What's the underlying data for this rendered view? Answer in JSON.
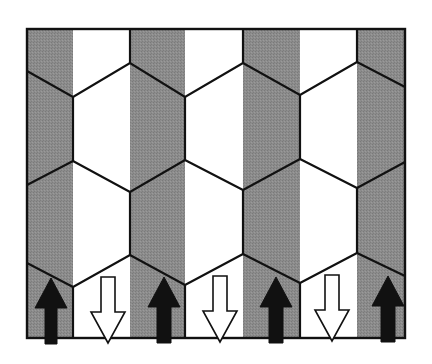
{
  "diagram": {
    "title": "",
    "colors": {
      "background": "#ffffff",
      "gray_stripe": "#8a8a8a",
      "white_stripe": "#ffffff",
      "line": "#111111",
      "up_arrow_fill": "#111111",
      "down_arrow_fill": "#ffffff",
      "down_arrow_stroke": "#111111"
    },
    "frame": {
      "x": 27,
      "y": 29,
      "right": 405,
      "bottom": 338
    },
    "stripes": [
      {
        "x0": 27,
        "x1": 73,
        "shade": "gray"
      },
      {
        "x0": 73,
        "x1": 130,
        "shade": "white"
      },
      {
        "x0": 130,
        "x1": 185,
        "shade": "gray"
      },
      {
        "x0": 185,
        "x1": 243,
        "shade": "white"
      },
      {
        "x0": 243,
        "x1": 300,
        "shade": "gray"
      },
      {
        "x0": 300,
        "x1": 357,
        "shade": "white"
      },
      {
        "x0": 357,
        "x1": 405,
        "shade": "gray"
      }
    ],
    "zigzags": [
      [
        [
          27,
          71
        ],
        [
          73,
          97
        ],
        [
          130,
          63
        ],
        [
          185,
          97
        ],
        [
          243,
          63
        ],
        [
          300,
          95
        ],
        [
          357,
          62
        ],
        [
          405,
          87
        ]
      ],
      [
        [
          27,
          185
        ],
        [
          73,
          161
        ],
        [
          130,
          192
        ],
        [
          185,
          160
        ],
        [
          243,
          190
        ],
        [
          300,
          159
        ],
        [
          357,
          188
        ],
        [
          405,
          162
        ]
      ],
      [
        [
          27,
          263
        ],
        [
          73,
          287
        ],
        [
          130,
          255
        ],
        [
          185,
          285
        ],
        [
          243,
          254
        ],
        [
          300,
          283
        ],
        [
          357,
          253
        ],
        [
          405,
          276
        ]
      ]
    ],
    "verticals": [
      [
        130,
        29,
        130,
        63
      ],
      [
        243,
        29,
        243,
        63
      ],
      [
        357,
        29,
        357,
        62
      ],
      [
        73,
        97,
        73,
        161
      ],
      [
        185,
        97,
        185,
        160
      ],
      [
        300,
        95,
        300,
        159
      ],
      [
        130,
        192,
        130,
        255
      ],
      [
        243,
        190,
        243,
        254
      ],
      [
        357,
        188,
        357,
        253
      ],
      [
        73,
        287,
        73,
        338
      ],
      [
        185,
        285,
        185,
        338
      ],
      [
        300,
        283,
        300,
        338
      ]
    ],
    "arrows_up": [
      {
        "cx": 51,
        "tip": 278,
        "head_base": 308,
        "bottom": 344,
        "head_half": 16,
        "shaft_half": 6
      },
      {
        "cx": 164,
        "tip": 277,
        "head_base": 307,
        "bottom": 343,
        "head_half": 16,
        "shaft_half": 7
      },
      {
        "cx": 276,
        "tip": 277,
        "head_base": 307,
        "bottom": 343,
        "head_half": 16,
        "shaft_half": 7
      },
      {
        "cx": 388,
        "tip": 276,
        "head_base": 306,
        "bottom": 342,
        "head_half": 16,
        "shaft_half": 7
      }
    ],
    "arrows_down": [
      {
        "cx": 108,
        "top": 277,
        "head_base": 312,
        "tip": 343,
        "head_half": 17,
        "shaft_half": 7
      },
      {
        "cx": 220,
        "top": 276,
        "head_base": 311,
        "tip": 342,
        "head_half": 17,
        "shaft_half": 7
      },
      {
        "cx": 332,
        "top": 275,
        "head_base": 310,
        "tip": 341,
        "head_half": 17,
        "shaft_half": 7
      }
    ]
  }
}
